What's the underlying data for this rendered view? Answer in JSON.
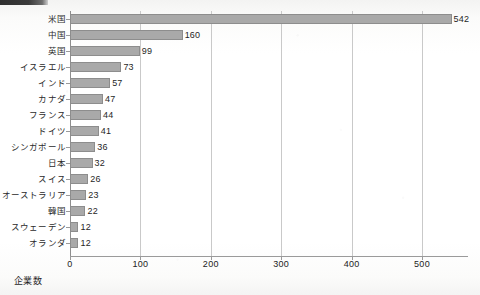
{
  "artifact": {
    "name": "scan-edge-artifact"
  },
  "chart_data": {
    "type": "bar",
    "orientation": "horizontal",
    "title": "",
    "subtitle": "",
    "xlabel": "企業数",
    "ylabel": "",
    "xlim": [
      0,
      565
    ],
    "xticks": [
      0,
      100,
      200,
      300,
      400,
      500
    ],
    "xtick_labels": [
      "0",
      "100",
      "200",
      "300",
      "400",
      "500"
    ],
    "grid": true,
    "grid_axis": "x",
    "legend": false,
    "legend_position": "none",
    "bar_color": "#a9a9a9",
    "bar_border_color": "#8d8d8d",
    "gridline_color": "#c9c9c9",
    "axis_color": "#9a9a9a",
    "text_color": "#1f1f1f",
    "value_labels": true,
    "categories": [
      "米国",
      "中国",
      "英国",
      "イスラエル",
      "インド",
      "カナダ",
      "フランス",
      "ドイツ",
      "シンガポール",
      "日本",
      "スイス",
      "オーストラリア",
      "韓国",
      "スウェーデン",
      "オランダ"
    ],
    "values": [
      542,
      160,
      99,
      73,
      57,
      47,
      44,
      41,
      36,
      32,
      26,
      23,
      22,
      12,
      12
    ],
    "value_label_texts": [
      "542",
      "160",
      "99",
      "73",
      "57",
      "47",
      "44",
      "41",
      "36",
      "32",
      "26",
      "23",
      "22",
      "12",
      "12"
    ]
  }
}
